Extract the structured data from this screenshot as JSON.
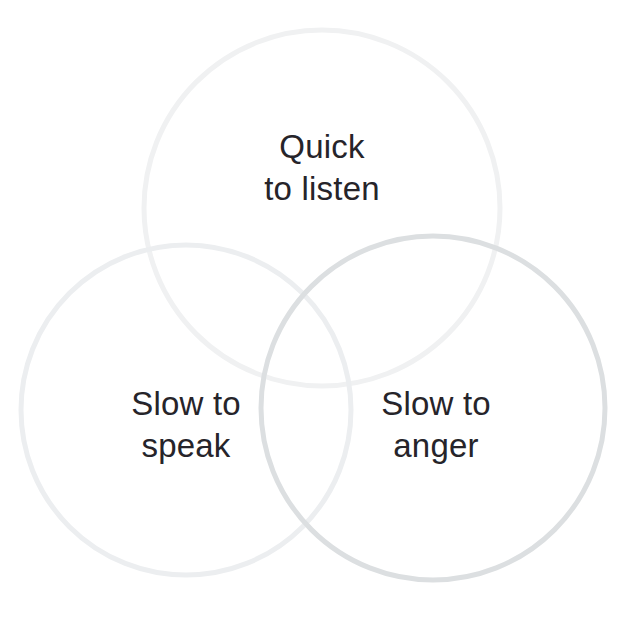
{
  "diagram": {
    "type": "venn-3-circle",
    "title_visible": false,
    "background_color": "#ffffff",
    "text_color": "#26242a",
    "circles": [
      {
        "id": "top",
        "label": "Quick\nto listen",
        "label_line_1": "Quick",
        "label_line_2": "to listen",
        "center_x": 322,
        "center_y": 208,
        "radius": 178,
        "stroke_color": "#f0f1f2",
        "stroke_width": 5
      },
      {
        "id": "left",
        "label": "Slow to\nspeak",
        "label_line_1": "Slow to",
        "label_line_2": "speak",
        "center_x": 186,
        "center_y": 410,
        "radius": 165,
        "stroke_color": "#eceef0",
        "stroke_width": 5
      },
      {
        "id": "right",
        "label": "Slow to\nanger",
        "label_line_1": "Slow to",
        "label_line_2": "anger",
        "center_x": 433,
        "center_y": 408,
        "radius": 172,
        "stroke_color": "#dcdfe1",
        "stroke_width": 5
      }
    ],
    "labels": {
      "top": "Quick\nto listen",
      "left": "Slow to\nspeak",
      "right": "Slow to\nanger"
    }
  }
}
